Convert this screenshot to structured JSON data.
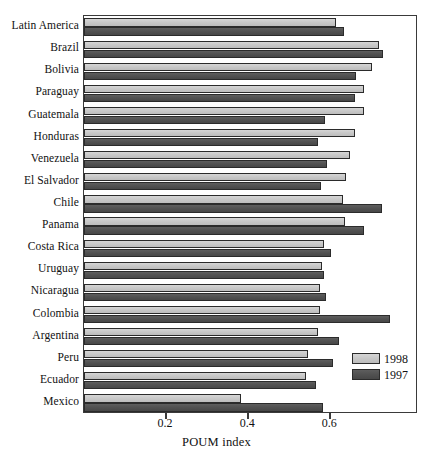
{
  "chart_data": {
    "type": "bar",
    "orientation": "horizontal",
    "title": "",
    "xlabel": "POUM index",
    "ylabel": "",
    "xlim": [
      0,
      0.814
    ],
    "xticks": [
      0.2,
      0.4,
      0.6
    ],
    "xticklabels": [
      "0.2",
      "0.4",
      "0.6"
    ],
    "grid": false,
    "legend_position": "inside-lower-right",
    "categories": [
      "Latin America",
      "Brazil",
      "Bolivia",
      "Paraguay",
      "Guatemala",
      "Honduras",
      "Venezuela",
      "El Salvador",
      "Chile",
      "Panama",
      "Costa Rica",
      "Uruguay",
      "Nicaragua",
      "Colombia",
      "Argentina",
      "Peru",
      "Ecuador",
      "Mexico"
    ],
    "series": [
      {
        "name": "1998",
        "color": "#c9c9c9",
        "values": [
          0.615,
          0.72,
          0.702,
          0.683,
          0.683,
          0.661,
          0.649,
          0.639,
          0.632,
          0.637,
          0.585,
          0.58,
          0.576,
          0.576,
          0.571,
          0.546,
          0.541,
          0.383
        ]
      },
      {
        "name": "1997",
        "color": "#525252",
        "values": [
          0.634,
          0.729,
          0.663,
          0.661,
          0.588,
          0.571,
          0.593,
          0.578,
          0.727,
          0.683,
          0.602,
          0.585,
          0.59,
          0.746,
          0.622,
          0.607,
          0.566,
          0.583
        ]
      }
    ]
  },
  "legend": {
    "entries": [
      {
        "label": "1998"
      },
      {
        "label": "1997"
      }
    ]
  },
  "axis": {
    "x_title": "POUM index"
  }
}
